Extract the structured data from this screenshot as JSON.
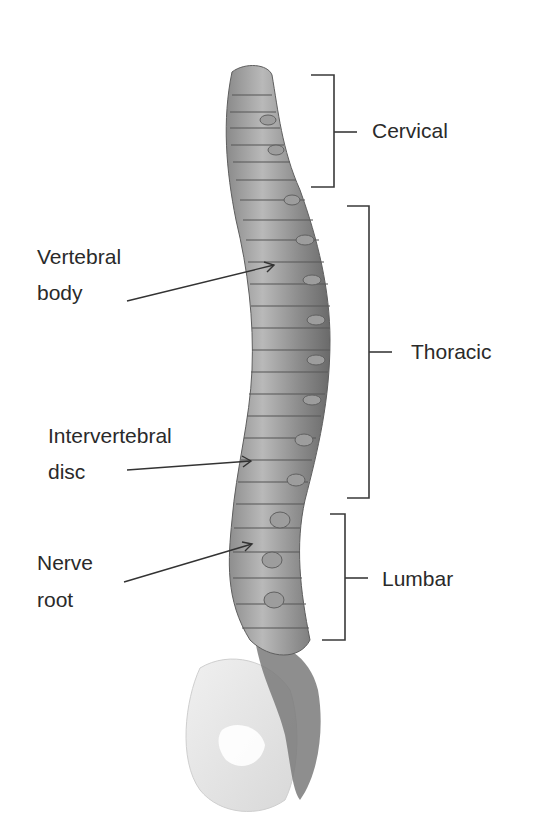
{
  "figure": {
    "type": "anatomical diagram",
    "regions": [
      {
        "label": "Cervical",
        "bracket": {
          "x": 334,
          "top": 75,
          "bottom": 187,
          "tick_y": 132
        }
      },
      {
        "label": "Thoracic",
        "bracket": {
          "x": 369,
          "top": 206,
          "bottom": 498,
          "tick_y": 352
        }
      },
      {
        "label": "Lumbar",
        "bracket": {
          "x": 345,
          "top": 514,
          "bottom": 640,
          "tick_y": 578
        }
      }
    ],
    "callouts": [
      {
        "line1": "Vertebral",
        "line2": "body",
        "arrow": {
          "x1": 127,
          "y1": 301,
          "x2": 274,
          "y2": 265
        }
      },
      {
        "line1": "Intervertebral",
        "line2": "disc",
        "arrow": {
          "x1": 127,
          "y1": 470,
          "x2": 251,
          "y2": 461
        }
      },
      {
        "line1": "Nerve",
        "line2": "root",
        "arrow": {
          "x1": 124,
          "y1": 582,
          "x2": 252,
          "y2": 544
        }
      }
    ],
    "colors": {
      "line": "#3a3a3a",
      "text": "#2a2a2a",
      "bone_dark": "#6e6e6e",
      "bone_mid": "#9a9a9a",
      "bone_light": "#cfcfcf",
      "pelvis": "#e6e6e6"
    }
  }
}
